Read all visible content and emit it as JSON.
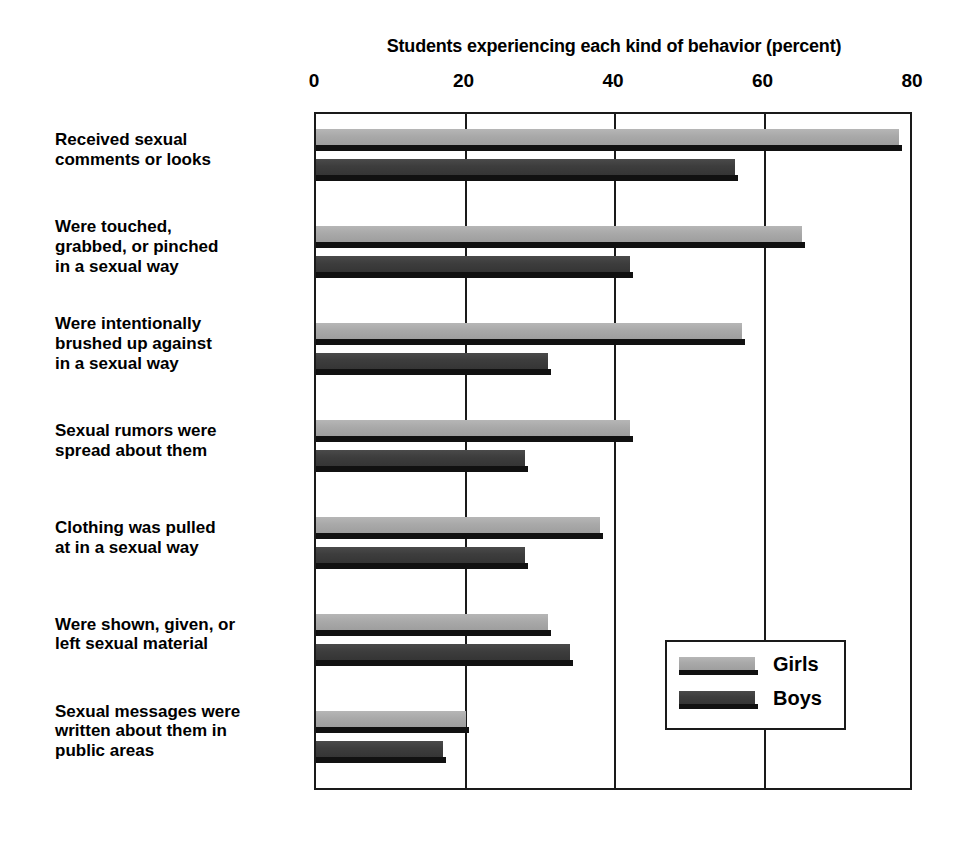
{
  "chart_data": {
    "type": "bar",
    "orientation": "horizontal",
    "title": "Students experiencing each kind of behavior (percent)",
    "xlabel": "",
    "ylabel": "",
    "xlim": [
      0,
      80
    ],
    "xticks": [
      0,
      20,
      40,
      60,
      80
    ],
    "grid": true,
    "legend_position": "inside-bottom-right",
    "categories": [
      "Received sexual\ncomments or looks",
      "Were touched,\ngrabbed, or pinched\nin a sexual way",
      "Were intentionally\nbrushed up against\nin a sexual way",
      "Sexual rumors were\nspread about them",
      "Clothing was pulled\nat in a sexual way",
      "Were shown, given, or\nleft sexual material",
      "Sexual messages were\nwritten about them in\npublic areas"
    ],
    "series": [
      {
        "name": "Girls",
        "color": "#a9a9a9",
        "values": [
          78,
          65,
          57,
          42,
          38,
          31,
          20
        ]
      },
      {
        "name": "Boys",
        "color": "#3d3d3d",
        "values": [
          56,
          42,
          31,
          28,
          28,
          34,
          17
        ]
      }
    ]
  },
  "legend": {
    "entries": [
      {
        "label": "Girls"
      },
      {
        "label": "Boys"
      }
    ]
  },
  "colors": {
    "girls": "#a9a9a9",
    "boys": "#3d3d3d",
    "axis": "#1a1a1a",
    "background": "#ffffff"
  }
}
